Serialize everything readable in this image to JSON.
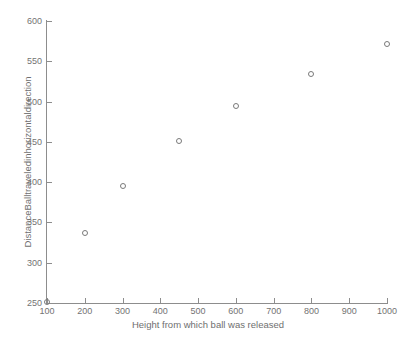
{
  "chart_data": {
    "type": "scatter",
    "title": "",
    "xlabel": "Height from which ball was released",
    "ylabel": "DistanceBalltraveledinhorizontaldirection",
    "xlim": [
      100,
      1000
    ],
    "ylim": [
      250,
      600
    ],
    "grid": false,
    "legend": null,
    "marker_style": "open-circle",
    "marker_color": "#7a7a7a",
    "xticks": [
      100,
      200,
      300,
      400,
      500,
      600,
      700,
      800,
      900,
      1000
    ],
    "xticklabels": [
      "100",
      "200",
      "300",
      "400",
      "500",
      "600",
      "700",
      "800",
      "900",
      "1000"
    ],
    "yticks": [
      250,
      300,
      350,
      400,
      450,
      500,
      550,
      600
    ],
    "yticklabels": [
      "250",
      "300",
      "350",
      "400",
      "450",
      "500",
      "550",
      "600"
    ],
    "x": [
      100,
      200,
      300,
      450,
      600,
      800,
      1000
    ],
    "y": [
      251,
      337,
      395,
      451,
      495,
      534,
      572
    ],
    "points": [
      {
        "x": 100,
        "y": 251
      },
      {
        "x": 200,
        "y": 337
      },
      {
        "x": 300,
        "y": 395
      },
      {
        "x": 450,
        "y": 451
      },
      {
        "x": 600,
        "y": 495
      },
      {
        "x": 800,
        "y": 534
      },
      {
        "x": 1000,
        "y": 572
      }
    ],
    "axis_color": "#8d8d8d",
    "tick_label_color": "#737373",
    "axis_label_color": "#6f6f6f",
    "background": "#ffffff"
  }
}
